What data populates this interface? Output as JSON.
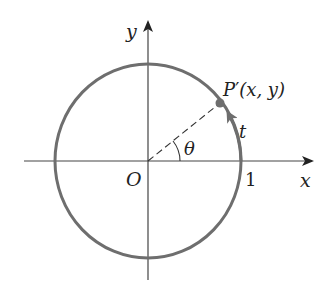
{
  "diagram": {
    "type": "unit-circle",
    "labels": {
      "y_axis": "y",
      "x_axis": "x",
      "origin": "O",
      "unit_tick": "1",
      "angle": "θ",
      "arc_length": "t",
      "point_P": "P",
      "point_prime": "′",
      "point_coords": "(x, y)"
    },
    "colors": {
      "axes": "#333333",
      "circle": "#6e6e6e",
      "point": "#6e6e6e",
      "dashed_radius": "#333333",
      "text": "#222222"
    }
  }
}
